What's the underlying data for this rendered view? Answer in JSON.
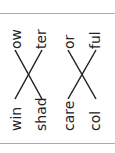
{
  "worksheet": {
    "title": "Match word parts",
    "groups": [
      {
        "left": [
          "win",
          "shad"
        ],
        "right": [
          "ow",
          "ter"
        ],
        "matches": [
          [
            "win",
            "ter"
          ],
          [
            "shad",
            "ow"
          ]
        ]
      },
      {
        "left": [
          "care",
          "col"
        ],
        "right": [
          "or",
          "ful"
        ],
        "matches": [
          [
            "care",
            "ful"
          ],
          [
            "col",
            "or"
          ]
        ]
      }
    ]
  }
}
